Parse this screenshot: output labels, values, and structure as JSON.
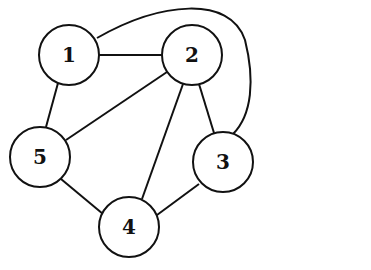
{
  "graph": {
    "nodes": [
      {
        "id": "1",
        "label": "1",
        "cx": 69,
        "cy": 55
      },
      {
        "id": "2",
        "label": "2",
        "cx": 192,
        "cy": 55
      },
      {
        "id": "3",
        "label": "3",
        "cx": 223,
        "cy": 162
      },
      {
        "id": "4",
        "label": "4",
        "cx": 129,
        "cy": 227
      },
      {
        "id": "5",
        "label": "5",
        "cx": 40,
        "cy": 157
      }
    ],
    "edges": [
      [
        "1",
        "2"
      ],
      [
        "1",
        "5"
      ],
      [
        "1",
        "3"
      ],
      [
        "2",
        "5"
      ],
      [
        "2",
        "4"
      ],
      [
        "2",
        "3"
      ],
      [
        "5",
        "4"
      ],
      [
        "4",
        "3"
      ]
    ],
    "node_radius": 30
  }
}
